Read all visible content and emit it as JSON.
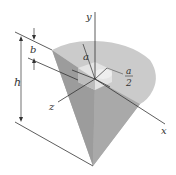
{
  "figure": {
    "labels": {
      "y_axis": "y",
      "x_axis": "x",
      "z_axis": "z",
      "a_top": "a",
      "a_half_num": "a",
      "a_half_den": "2",
      "b_dim": "b",
      "h_dim": "h"
    },
    "colors": {
      "top_face": "#c9c9c9",
      "side_face_dark": "#9a9a9a",
      "side_face_light": "#b5b5b5",
      "cavity": "#e2e2e2",
      "line": "#333333"
    }
  }
}
